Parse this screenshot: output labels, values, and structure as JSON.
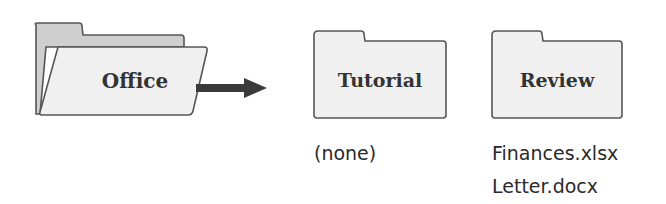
{
  "diagram": {
    "colors": {
      "folder_fill": "#f0f0f0",
      "folder_back_fill": "#cfcfcf",
      "folder_stroke": "#555555",
      "arrow": "#3a3a3a",
      "text": "#333333"
    },
    "source_folder": {
      "label": "Office",
      "state": "open"
    },
    "arrow": {
      "direction": "right"
    },
    "folders": [
      {
        "label": "Tutorial",
        "contents": [
          "(none)"
        ]
      },
      {
        "label": "Review",
        "contents": [
          "Finances.xlsx",
          "Letter.docx"
        ]
      }
    ]
  }
}
